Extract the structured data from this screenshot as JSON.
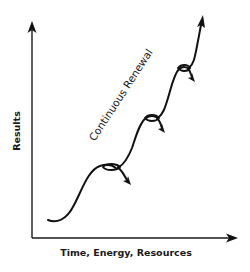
{
  "diagram": {
    "type": "growth-curve",
    "y_axis": {
      "label": "Results"
    },
    "x_axis": {
      "label": "Time, Energy, Resources"
    },
    "curve_label": "Continuous Renewal",
    "stages": [
      {
        "name": "stage-1",
        "plateau": "first loop with downward decline arrow"
      },
      {
        "name": "stage-2",
        "plateau": "second loop with downward decline arrow"
      },
      {
        "name": "stage-3",
        "plateau": "third loop with downward decline arrow"
      }
    ],
    "end": "upward arrow continuing growth",
    "colors": {
      "line": "#111111",
      "background": "#ffffff"
    }
  }
}
